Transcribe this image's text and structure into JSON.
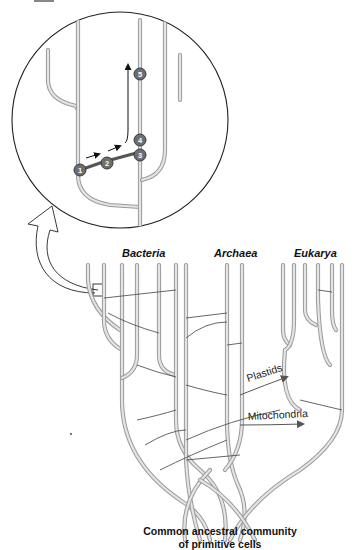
{
  "diagram": {
    "type": "phylogenetic-tree-with-horizontal-gene-transfer",
    "domains": [
      {
        "label": "Bacteria"
      },
      {
        "label": "Archaea"
      },
      {
        "label": "Eukarya"
      }
    ],
    "organelle_transfers": [
      {
        "label": "Plastids"
      },
      {
        "label": "Mitochondria"
      }
    ],
    "root_label_line1": "Common ancestral community",
    "root_label_line2": "of primitive cells",
    "inset": {
      "description": "Magnified view of horizontal gene transfer between lineages",
      "steps": [
        "1",
        "2",
        "3",
        "4",
        "5"
      ]
    },
    "colors": {
      "branch_outline": "#9a9a9a",
      "branch_fill": "#e4e4e4",
      "transfer_line": "#555555",
      "step_marker": "#6e6e6e"
    }
  }
}
